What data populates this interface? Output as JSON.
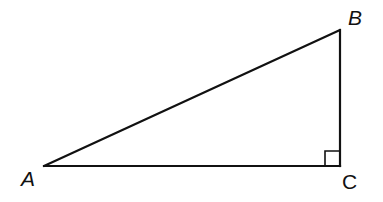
{
  "diagram": {
    "type": "right-triangle",
    "stroke_color": "#111111",
    "background": "#ffffff",
    "vertices": {
      "A": {
        "label": "A",
        "x": 44,
        "y": 166
      },
      "B": {
        "label": "B",
        "x": 340,
        "y": 30
      },
      "C": {
        "label": "C",
        "x": 340,
        "y": 166
      }
    },
    "right_angle_at": "C",
    "right_angle_marker_size": 15,
    "sides": [
      "AB",
      "BC",
      "AC"
    ]
  }
}
